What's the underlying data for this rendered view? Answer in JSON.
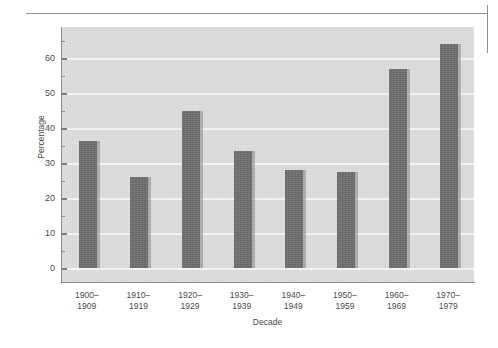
{
  "chart_data": {
    "type": "bar",
    "title": "",
    "subtitle": "",
    "xlabel": "Decade",
    "ylabel": "Percentage",
    "categories": [
      "1900–\n1909",
      "1910–\n1919",
      "1920–\n1929",
      "1930–\n1939",
      "1940–\n1949",
      "1950–\n1959",
      "1960–\n1969",
      "1970–\n1979"
    ],
    "values": [
      36.5,
      26,
      45,
      33.5,
      28,
      27.5,
      57,
      64
    ],
    "ylim": [
      0,
      69
    ],
    "xlim_note": "8 equally spaced categorical bars",
    "yticks": [
      0,
      10,
      20,
      30,
      40,
      50,
      60
    ],
    "ytick_labels": [
      "0",
      "10",
      "20",
      "30",
      "40",
      "50",
      "60"
    ],
    "yminorticks": [
      5,
      15,
      25,
      35,
      45,
      55,
      65
    ],
    "grid": "horizontal white gridlines at major ticks",
    "legend": "none",
    "legend_position": "none",
    "series": [
      {
        "name": "Percentage",
        "values": [
          36.5,
          26,
          45,
          33.5,
          28,
          27.5,
          57,
          64
        ]
      }
    ],
    "annotations": []
  },
  "style": {
    "bar_color": "#6b6b6b",
    "bar_shadow_color": "#8c8c8c",
    "panel_background": "#dcdcdc",
    "gridline_color": "#f6f6f6",
    "axis_color": "#8a8a8a",
    "text_color": "#4a4a4a",
    "page_background": "#ffffff"
  },
  "page": {
    "rule_label": "page-rule",
    "crop_mark_label": "crop-mark"
  }
}
